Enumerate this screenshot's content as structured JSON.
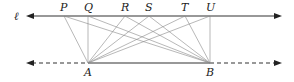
{
  "diagram": {
    "line_label": "ℓ",
    "top_points": [
      {
        "label": "P",
        "x": 64
      },
      {
        "label": "Q",
        "x": 88
      },
      {
        "label": "R",
        "x": 125
      },
      {
        "label": "S",
        "x": 149
      },
      {
        "label": "T",
        "x": 185
      },
      {
        "label": "U",
        "x": 210
      }
    ],
    "bottom_points": [
      {
        "label": "A",
        "x": 88
      },
      {
        "label": "B",
        "x": 210
      }
    ],
    "top_line_y": 16,
    "bottom_line_y": 63,
    "colors": {
      "line": "#333333",
      "connector": "#888888",
      "text": "#222222"
    }
  }
}
